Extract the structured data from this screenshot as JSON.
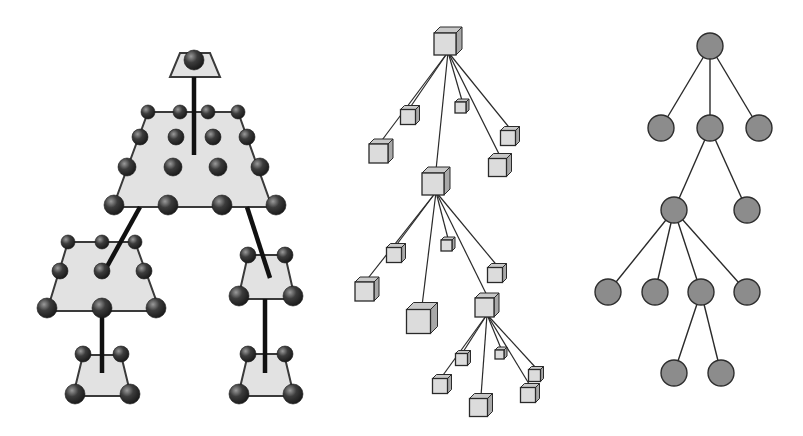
{
  "colors": {
    "background": "#ffffff",
    "plate_fill": "#e2e2e2",
    "plate_stroke": "#3a3a3a",
    "sphere_dark": "#2a2a2a",
    "sphere_light": "#8a8a8a",
    "stem": "#111111",
    "box_front": "#dcdcdc",
    "box_side": "#a8a8a8",
    "box_top": "#c8c8c8",
    "box_stroke": "#2a2a2a",
    "edge": "#2a2a2a",
    "circle_fill": "#8c8c8c",
    "circle_stroke": "#2e2e2e"
  },
  "diagrams": [
    {
      "id": "plates",
      "description": "Hierarchy of trapezoid plates with spheres connected by thick stems",
      "plates": [
        {
          "name": "top",
          "pts": [
            [
              180,
              53
            ],
            [
              210,
              53
            ],
            [
              220,
              77
            ],
            [
              170,
              77
            ]
          ],
          "stem_from": [
            194,
            77
          ],
          "stem_to": [
            194,
            155
          ],
          "spheres": [
            [
              194,
              60,
              10
            ]
          ]
        },
        {
          "name": "main",
          "pts": [
            [
              148,
              112
            ],
            [
              238,
              112
            ],
            [
              272,
              207
            ],
            [
              113,
              207
            ]
          ],
          "spheres": [
            [
              148,
              112,
              7
            ],
            [
              180,
              112,
              7
            ],
            [
              208,
              112,
              7
            ],
            [
              238,
              112,
              7
            ],
            [
              140,
              137,
              8
            ],
            [
              176,
              137,
              8
            ],
            [
              213,
              137,
              8
            ],
            [
              247,
              137,
              8
            ],
            [
              127,
              167,
              9
            ],
            [
              173,
              167,
              9
            ],
            [
              218,
              167,
              9
            ],
            [
              260,
              167,
              9
            ],
            [
              114,
              205,
              10
            ],
            [
              168,
              205,
              10
            ],
            [
              222,
              205,
              10
            ],
            [
              276,
              205,
              10
            ]
          ]
        },
        {
          "name": "left-mid",
          "pts": [
            [
              68,
              242
            ],
            [
              135,
              242
            ],
            [
              160,
              311
            ],
            [
              47,
              311
            ]
          ],
          "spheres": [
            [
              68,
              242,
              7
            ],
            [
              102,
              242,
              7
            ],
            [
              135,
              242,
              7
            ],
            [
              60,
              271,
              8
            ],
            [
              102,
              271,
              8
            ],
            [
              144,
              271,
              8
            ],
            [
              47,
              308,
              10
            ],
            [
              102,
              308,
              10
            ],
            [
              156,
              308,
              10
            ]
          ]
        },
        {
          "name": "right-mid",
          "pts": [
            [
              248,
              255
            ],
            [
              285,
              255
            ],
            [
              295,
              299
            ],
            [
              238,
              299
            ]
          ],
          "spheres": [
            [
              248,
              255,
              8
            ],
            [
              285,
              255,
              8
            ],
            [
              239,
              296,
              10
            ],
            [
              293,
              296,
              10
            ]
          ]
        },
        {
          "name": "left-bottom",
          "pts": [
            [
              83,
              355
            ],
            [
              121,
              355
            ],
            [
              131,
              396
            ],
            [
              73,
              396
            ]
          ],
          "spheres": [
            [
              83,
              354,
              8
            ],
            [
              121,
              354,
              8
            ],
            [
              75,
              394,
              10
            ],
            [
              130,
              394,
              10
            ]
          ]
        },
        {
          "name": "right-bottom",
          "pts": [
            [
              248,
              354
            ],
            [
              284,
              354
            ],
            [
              294,
              396
            ],
            [
              238,
              396
            ]
          ],
          "spheres": [
            [
              248,
              354,
              8
            ],
            [
              285,
              354,
              8
            ],
            [
              239,
              394,
              10
            ],
            [
              293,
              394,
              10
            ]
          ]
        }
      ],
      "stems": [
        [
          [
            194,
            77
          ],
          [
            194,
            155
          ]
        ],
        [
          [
            140,
            207
          ],
          [
            104,
            272
          ]
        ],
        [
          [
            247,
            207
          ],
          [
            270,
            278
          ]
        ],
        [
          [
            102,
            308
          ],
          [
            102,
            373
          ]
        ],
        [
          [
            265,
            299
          ],
          [
            265,
            373
          ]
        ]
      ]
    },
    {
      "id": "boxes",
      "description": "Tree of 3D cube nodes connected by thin lines",
      "nodes": [
        {
          "id": "r",
          "x": 448,
          "y": 41,
          "s": 22
        },
        {
          "id": "a",
          "x": 410,
          "y": 115,
          "s": 15
        },
        {
          "id": "b",
          "x": 381,
          "y": 151,
          "s": 19
        },
        {
          "id": "c",
          "x": 462,
          "y": 106,
          "s": 11
        },
        {
          "id": "d",
          "x": 510,
          "y": 136,
          "s": 15
        },
        {
          "id": "e",
          "x": 500,
          "y": 165,
          "s": 18
        },
        {
          "id": "f",
          "x": 436,
          "y": 181,
          "s": 22
        },
        {
          "id": "g",
          "x": 396,
          "y": 253,
          "s": 15
        },
        {
          "id": "h",
          "x": 367,
          "y": 289,
          "s": 19
        },
        {
          "id": "i",
          "x": 448,
          "y": 244,
          "s": 11
        },
        {
          "id": "j",
          "x": 497,
          "y": 273,
          "s": 15
        },
        {
          "id": "k",
          "x": 422,
          "y": 318,
          "s": 24
        },
        {
          "id": "l",
          "x": 487,
          "y": 305,
          "s": 19
        },
        {
          "id": "m",
          "x": 463,
          "y": 358,
          "s": 12
        },
        {
          "id": "n",
          "x": 442,
          "y": 384,
          "s": 15
        },
        {
          "id": "o",
          "x": 501,
          "y": 353,
          "s": 9
        },
        {
          "id": "p",
          "x": 536,
          "y": 374,
          "s": 12
        },
        {
          "id": "q",
          "x": 530,
          "y": 393,
          "s": 15
        },
        {
          "id": "t",
          "x": 481,
          "y": 405,
          "s": 18
        }
      ],
      "edges": [
        [
          "r",
          "a"
        ],
        [
          "r",
          "b"
        ],
        [
          "r",
          "c"
        ],
        [
          "r",
          "d"
        ],
        [
          "r",
          "e"
        ],
        [
          "r",
          "f"
        ],
        [
          "f",
          "g"
        ],
        [
          "f",
          "h"
        ],
        [
          "f",
          "i"
        ],
        [
          "f",
          "j"
        ],
        [
          "f",
          "k"
        ],
        [
          "f",
          "l"
        ],
        [
          "l",
          "m"
        ],
        [
          "l",
          "n"
        ],
        [
          "l",
          "o"
        ],
        [
          "l",
          "p"
        ],
        [
          "l",
          "q"
        ],
        [
          "l",
          "t"
        ]
      ]
    },
    {
      "id": "circles",
      "description": "Tree of circle nodes connected by lines",
      "radius": 13,
      "nodes": [
        {
          "id": "0",
          "x": 710,
          "y": 46
        },
        {
          "id": "1",
          "x": 661,
          "y": 128
        },
        {
          "id": "2",
          "x": 710,
          "y": 128
        },
        {
          "id": "3",
          "x": 759,
          "y": 128
        },
        {
          "id": "4",
          "x": 674,
          "y": 210
        },
        {
          "id": "5",
          "x": 747,
          "y": 210
        },
        {
          "id": "6",
          "x": 608,
          "y": 292
        },
        {
          "id": "7",
          "x": 655,
          "y": 292
        },
        {
          "id": "8",
          "x": 701,
          "y": 292
        },
        {
          "id": "9",
          "x": 747,
          "y": 292
        },
        {
          "id": "10",
          "x": 674,
          "y": 373
        },
        {
          "id": "11",
          "x": 721,
          "y": 373
        }
      ],
      "edges": [
        [
          "0",
          "1"
        ],
        [
          "0",
          "2"
        ],
        [
          "0",
          "3"
        ],
        [
          "2",
          "4"
        ],
        [
          "2",
          "5"
        ],
        [
          "4",
          "6"
        ],
        [
          "4",
          "7"
        ],
        [
          "4",
          "8"
        ],
        [
          "4",
          "9"
        ],
        [
          "8",
          "10"
        ],
        [
          "8",
          "11"
        ]
      ]
    }
  ]
}
